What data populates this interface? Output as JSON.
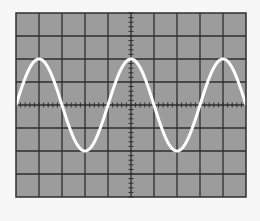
{
  "display": {
    "type": "oscilloscope-screen",
    "background_color": "#f7f7f7",
    "screen_color": "#9c9c9c",
    "grid_color": "#2e2e2e",
    "trace_color": "#ffffff",
    "screen": {
      "x": 16,
      "y": 13,
      "width": 230,
      "height": 184
    },
    "divisions": {
      "horizontal": 10,
      "vertical": 8
    },
    "minor_ticks_per_division": 5
  },
  "chart_data": {
    "type": "line",
    "title": "",
    "xlabel": "",
    "ylabel": "",
    "grid": true,
    "xlim": [
      0,
      10
    ],
    "ylim": [
      -4,
      4
    ],
    "series": [
      {
        "name": "trace",
        "function": "sine",
        "amplitude_div": 2,
        "period_div": 4,
        "phase_start_div": 0,
        "x": [
          0,
          1,
          2,
          3,
          4,
          5,
          6,
          7,
          8,
          9,
          10
        ],
        "values": [
          0,
          2,
          0,
          -2,
          0,
          2,
          0,
          -2,
          0,
          2,
          0
        ]
      }
    ]
  }
}
